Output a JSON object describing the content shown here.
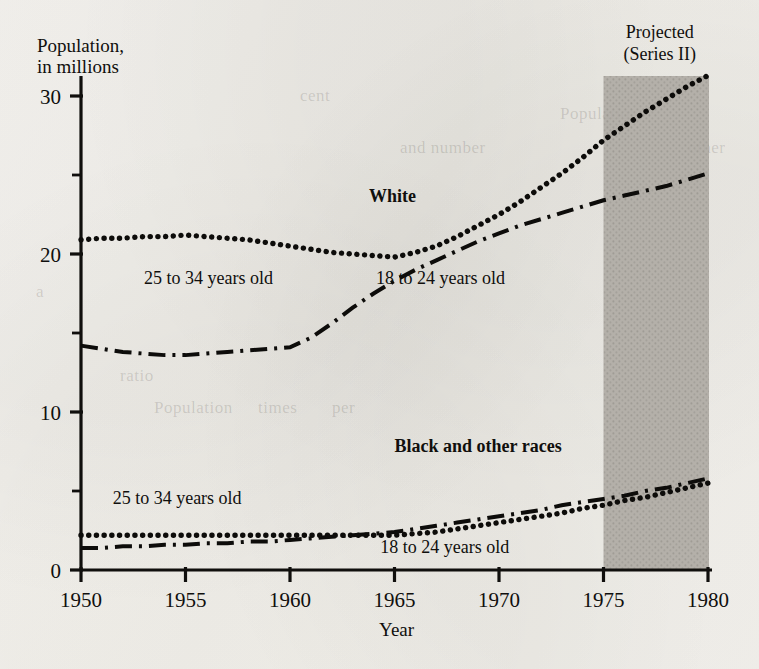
{
  "chart_data": {
    "type": "line",
    "title": "",
    "ylabel_line1": "Population,",
    "ylabel_line2": "in millions",
    "xlabel": "Year",
    "xlim": [
      1950,
      1980
    ],
    "ylim": [
      0,
      32
    ],
    "grid": false,
    "legend_position": "inline-annotations",
    "x_major_ticks": [
      "1950",
      "1955",
      "1960",
      "1965",
      "1970",
      "1975",
      "1980"
    ],
    "y_major_ticks": [
      "0",
      "10",
      "20",
      "30"
    ],
    "y_minor_ticks": [
      "5",
      "15",
      "25"
    ],
    "annotations": [
      {
        "text": "White",
        "bold": true,
        "x": 1964.9,
        "y": 23.3
      },
      {
        "text": "Black and other races",
        "bold": true,
        "x": 1969.0,
        "y": 7.5
      },
      {
        "text": "25 to 34 years old",
        "bold": false,
        "x": 1956.1,
        "y": 18.1
      },
      {
        "text": "18 to 24 years old",
        "bold": false,
        "x": 1967.2,
        "y": 18.1
      },
      {
        "text": "25 to 34 years old",
        "bold": false,
        "x": 1954.6,
        "y": 4.2
      },
      {
        "text": "18 to 24 years old",
        "bold": false,
        "x": 1967.4,
        "y": 1.1
      }
    ],
    "projection": {
      "label_line1": "Projected",
      "label_line2": "(Series II)",
      "start_year": 1975,
      "end_year": 1980,
      "shade_color": "#b8b4ae"
    },
    "x": [
      1950,
      1951,
      1952,
      1953,
      1954,
      1955,
      1956,
      1957,
      1958,
      1959,
      1960,
      1961,
      1962,
      1963,
      1964,
      1965,
      1966,
      1967,
      1968,
      1969,
      1970,
      1971,
      1972,
      1973,
      1974,
      1975,
      1976,
      1977,
      1978,
      1979,
      1980
    ],
    "series": [
      {
        "name": "White, 25 to 34 years old",
        "group": "White",
        "age": "25 to 34 years old",
        "style": "dotted",
        "values": [
          20.9,
          21.0,
          21.0,
          21.1,
          21.1,
          21.2,
          21.1,
          21.0,
          20.9,
          20.7,
          20.5,
          20.3,
          20.1,
          20.0,
          19.9,
          19.8,
          20.1,
          20.5,
          21.1,
          21.8,
          22.5,
          23.3,
          24.2,
          25.1,
          26.1,
          27.2,
          28.1,
          29.0,
          29.8,
          30.6,
          31.3
        ]
      },
      {
        "name": "White, 18 to 24 years old",
        "group": "White",
        "age": "18 to 24 years old",
        "style": "dash-dot",
        "values": [
          14.2,
          14.0,
          13.8,
          13.7,
          13.6,
          13.6,
          13.7,
          13.8,
          13.9,
          14.0,
          14.1,
          14.7,
          15.6,
          16.6,
          17.5,
          18.3,
          19.0,
          19.6,
          20.2,
          20.8,
          21.3,
          21.8,
          22.2,
          22.6,
          23.0,
          23.4,
          23.7,
          24.0,
          24.3,
          24.7,
          25.1
        ]
      },
      {
        "name": "Black and other races, 25 to 34 years old",
        "group": "Black and other races",
        "age": "25 to 34 years old",
        "style": "dotted",
        "values": [
          2.2,
          2.2,
          2.2,
          2.2,
          2.2,
          2.2,
          2.2,
          2.2,
          2.2,
          2.2,
          2.2,
          2.2,
          2.2,
          2.2,
          2.2,
          2.2,
          2.3,
          2.4,
          2.6,
          2.8,
          3.0,
          3.2,
          3.4,
          3.6,
          3.9,
          4.1,
          4.4,
          4.6,
          4.9,
          5.2,
          5.5
        ]
      },
      {
        "name": "Black and other races, 18 to 24 years old",
        "group": "Black and other races",
        "age": "18 to 24 years old",
        "style": "dash-dot",
        "values": [
          1.4,
          1.4,
          1.5,
          1.5,
          1.6,
          1.6,
          1.7,
          1.7,
          1.8,
          1.8,
          1.9,
          2.0,
          2.1,
          2.2,
          2.3,
          2.4,
          2.6,
          2.8,
          3.0,
          3.2,
          3.4,
          3.6,
          3.8,
          4.1,
          4.3,
          4.5,
          4.7,
          5.0,
          5.2,
          5.5,
          5.8
        ]
      }
    ]
  },
  "page_background": {
    "bleed_text": [
      {
        "text": "Population",
        "x": 560,
        "y": 118
      },
      {
        "text": "and number",
        "x": 400,
        "y": 152
      },
      {
        "text": "other",
        "x": 688,
        "y": 152
      },
      {
        "text": "a",
        "x": 36,
        "y": 296
      },
      {
        "text": "ratio",
        "x": 120,
        "y": 380
      },
      {
        "text": "Population",
        "x": 154,
        "y": 412
      },
      {
        "text": "times",
        "x": 258,
        "y": 412
      },
      {
        "text": "per",
        "x": 332,
        "y": 412
      },
      {
        "text": "cent",
        "x": 300,
        "y": 100
      }
    ]
  }
}
